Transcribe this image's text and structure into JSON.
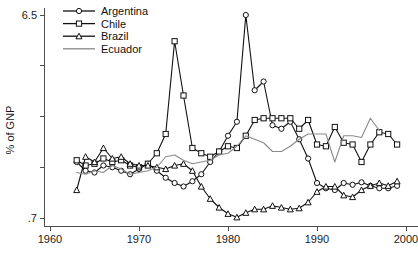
{
  "chart_data": {
    "type": "line",
    "title": "",
    "xlabel": "",
    "ylabel": "% of GNP",
    "xlim": [
      1960,
      2000
    ],
    "ylim": [
      0.7,
      6.5
    ],
    "grid": false,
    "legend_position": "top-left",
    "xticks": [
      1960,
      1970,
      1980,
      1990,
      2000
    ],
    "xtick_labels": [
      "1960",
      "1970",
      "1980",
      "1990",
      "2000"
    ],
    "yticks": [
      6.5,
      0.7
    ],
    "ytick_labels": [
      "6.5",
      ".7"
    ],
    "y_minor_ticks": [
      5.05,
      3.6,
      2.15
    ],
    "series": [
      {
        "name": "Argentina",
        "marker": "circle",
        "color": "#111111",
        "x": [
          1963,
          1964,
          1965,
          1966,
          1967,
          1968,
          1969,
          1970,
          1971,
          1972,
          1973,
          1974,
          1975,
          1976,
          1977,
          1978,
          1979,
          1980,
          1981,
          1982,
          1983,
          1984,
          1985,
          1986,
          1987,
          1988,
          1989,
          1990,
          1991,
          1992,
          1993,
          1994,
          1995,
          1996,
          1997,
          1998,
          1999
        ],
        "y": [
          2.3,
          2.05,
          2.0,
          2.2,
          2.15,
          2.05,
          1.95,
          2.1,
          2.25,
          2.05,
          1.85,
          1.7,
          1.6,
          1.75,
          1.95,
          2.3,
          2.6,
          3.05,
          3.45,
          6.5,
          4.35,
          4.6,
          3.35,
          3.25,
          3.45,
          2.95,
          2.4,
          1.7,
          1.55,
          1.5,
          1.7,
          1.65,
          1.72,
          1.62,
          1.55,
          1.55,
          1.62
        ],
        "note": "Sharp peak at 6.5 in 1982 (Falklands/Malvinas), declines after 1990"
      },
      {
        "name": "Chile",
        "marker": "square",
        "color": "#111111",
        "x": [
          1963,
          1964,
          1965,
          1966,
          1967,
          1968,
          1969,
          1970,
          1971,
          1972,
          1973,
          1974,
          1975,
          1976,
          1977,
          1978,
          1979,
          1980,
          1981,
          1982,
          1983,
          1984,
          1985,
          1986,
          1987,
          1988,
          1989,
          1990,
          1991,
          1992,
          1993,
          1994,
          1995,
          1996,
          1997,
          1998,
          1999
        ],
        "y": [
          2.35,
          2.2,
          2.25,
          2.4,
          2.3,
          2.35,
          2.2,
          2.15,
          2.25,
          2.55,
          3.1,
          5.75,
          4.2,
          2.7,
          2.55,
          2.45,
          2.6,
          2.75,
          2.7,
          3.05,
          3.5,
          3.55,
          3.55,
          3.55,
          3.55,
          3.25,
          3.5,
          2.8,
          2.75,
          3.3,
          2.85,
          2.8,
          2.3,
          2.8,
          3.15,
          3.1,
          2.8
        ],
        "note": "Large spike at 5.75 in 1974, plateau around 3.55 in mid-1980s"
      },
      {
        "name": "Brazil",
        "marker": "triangle",
        "color": "#111111",
        "x": [
          1963,
          1964,
          1965,
          1966,
          1967,
          1968,
          1969,
          1970,
          1971,
          1972,
          1973,
          1974,
          1975,
          1976,
          1977,
          1978,
          1979,
          1980,
          1981,
          1982,
          1983,
          1984,
          1985,
          1986,
          1987,
          1988,
          1989,
          1990,
          1991,
          1992,
          1993,
          1994,
          1995,
          1996,
          1997,
          1998,
          1999
        ],
        "y": [
          1.5,
          2.45,
          2.3,
          2.7,
          2.4,
          2.45,
          2.25,
          2.2,
          2.2,
          2.15,
          2.1,
          2.2,
          2.25,
          2.05,
          1.6,
          1.25,
          1.0,
          0.82,
          0.72,
          0.85,
          0.95,
          0.95,
          1.05,
          1.0,
          0.95,
          0.98,
          1.15,
          1.45,
          1.6,
          1.6,
          1.35,
          1.3,
          1.5,
          1.62,
          1.7,
          1.62,
          1.75
        ],
        "note": "Declines through late 1970s to minimum near .7 in 1981, recovers gradually"
      },
      {
        "name": "Ecuador",
        "marker": "none",
        "color": "#8a8a8a",
        "x": [
          1963,
          1964,
          1965,
          1966,
          1967,
          1968,
          1969,
          1970,
          1971,
          1972,
          1973,
          1974,
          1975,
          1976,
          1977,
          1978,
          1979,
          1980,
          1981,
          1982,
          1983,
          1984,
          1985,
          1986,
          1987,
          1988,
          1989,
          1990,
          1991,
          1992,
          1993,
          1994,
          1995,
          1996,
          1997
        ],
        "y": [
          2.0,
          1.95,
          2.05,
          2.0,
          2.2,
          2.1,
          1.95,
          2.0,
          2.05,
          2.15,
          2.45,
          2.5,
          2.35,
          2.25,
          2.3,
          2.35,
          2.5,
          2.55,
          2.75,
          3.05,
          2.95,
          2.85,
          2.6,
          2.6,
          2.75,
          2.95,
          3.1,
          3.1,
          3.1,
          2.3,
          3.05,
          3.05,
          3.0,
          3.55,
          3.2
        ],
        "note": "Plain gray line with no markers, series ends in 1997"
      }
    ]
  },
  "legend": {
    "items": [
      {
        "label": "Argentina",
        "marker": "circle-marker"
      },
      {
        "label": "Chile",
        "marker": "square-marker"
      },
      {
        "label": "Brazil",
        "marker": "triangle-marker"
      },
      {
        "label": "Ecuador",
        "marker": "line-only"
      }
    ]
  },
  "colors": {
    "series_dark": "#111111",
    "series_gray": "#8a8a8a",
    "axis": "#4d4d4d",
    "background": "#ffffff"
  }
}
